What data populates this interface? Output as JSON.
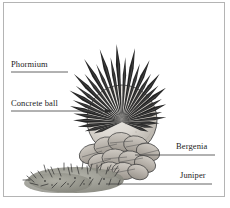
{
  "figure": {
    "background_color": "#ffffff",
    "frame_color": "#b4b4b4",
    "ink_color": "#1c1c1c"
  },
  "labels": [
    {
      "id": "phormium",
      "text": "Phormium",
      "side": "left",
      "leader_line": true,
      "arrow": false,
      "target": "spiky-strap-leaves"
    },
    {
      "id": "concrete_ball",
      "text": "Concrete ball",
      "side": "left",
      "leader_line": true,
      "arrow": true,
      "target": "concrete-sphere"
    },
    {
      "id": "bergenia",
      "text": "Bergenia",
      "side": "right",
      "leader_line": true,
      "arrow": false,
      "target": "broad-round-leaves"
    },
    {
      "id": "juniper",
      "text": "Juniper",
      "side": "right",
      "leader_line": true,
      "arrow": false,
      "target": "low-spreading-conifer"
    }
  ],
  "elements": {
    "phormium": {
      "name": "Phormium",
      "description": "Upright radiating strap-shaped leaves forming a fan above the ball"
    },
    "concrete_ball": {
      "name": "Concrete ball",
      "description": "Large light grey sphere ornament set in the planting bed",
      "fill_color": "#dedad4"
    },
    "bergenia": {
      "name": "Bergenia",
      "description": "Clump of broad rounded leaves at the base of the ball",
      "fill_color": "#b9b4ad"
    },
    "juniper": {
      "name": "Juniper",
      "description": "Low spreading needled conifer groundcover at front left",
      "fill_color": "#8d8d85"
    }
  }
}
